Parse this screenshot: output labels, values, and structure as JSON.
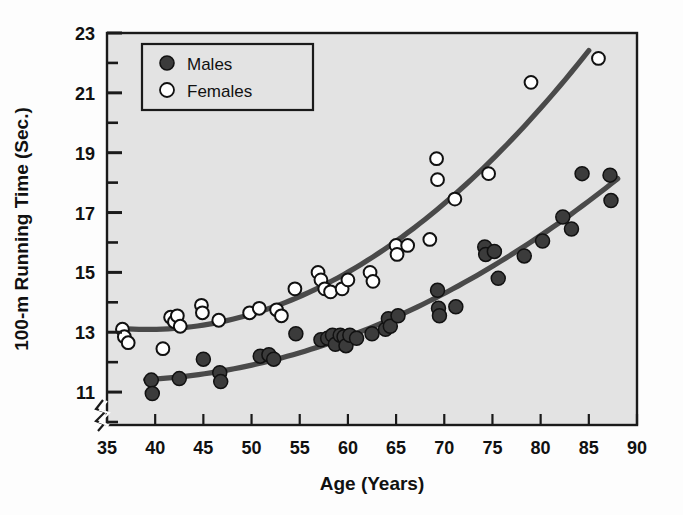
{
  "chart_data": {
    "type": "scatter",
    "title": "",
    "subtitle": "",
    "xlabel": "Age (Years)",
    "ylabel": "100-m Running Time (Sec.)",
    "xlim": [
      35,
      90
    ],
    "ylim": [
      9.9,
      23
    ],
    "xticks": [
      35,
      40,
      45,
      50,
      55,
      60,
      65,
      70,
      75,
      80,
      85,
      90
    ],
    "xtick_labels": [
      "35",
      "40",
      "45",
      "50",
      "55",
      "60",
      "65",
      "70",
      "75",
      "80",
      "85",
      "90"
    ],
    "yticks": [
      11,
      13,
      15,
      17,
      19,
      21,
      23
    ],
    "ytick_labels": [
      "11",
      "13",
      "15",
      "17",
      "19",
      "21",
      "23"
    ],
    "y_minor_ticks": [
      10,
      12,
      14,
      16,
      18,
      20,
      22
    ],
    "grid": false,
    "axis_break": true,
    "legend_position": "top-left",
    "plot_background": "#e2e2e2",
    "frame_color": "#1a1a1a",
    "series": [
      {
        "name": "Males",
        "marker": "filled-circle",
        "color": "#3b3b3b",
        "edge_color": "#111111",
        "points": [
          [
            39.6,
            11.4
          ],
          [
            39.7,
            10.95
          ],
          [
            42.5,
            11.45
          ],
          [
            45.0,
            12.1
          ],
          [
            46.7,
            11.65
          ],
          [
            46.8,
            11.35
          ],
          [
            50.9,
            12.2
          ],
          [
            51.8,
            12.25
          ],
          [
            52.3,
            12.1
          ],
          [
            54.6,
            12.95
          ],
          [
            57.2,
            12.75
          ],
          [
            57.9,
            12.8
          ],
          [
            58.4,
            12.9
          ],
          [
            58.7,
            12.6
          ],
          [
            59.2,
            12.9
          ],
          [
            59.6,
            12.85
          ],
          [
            59.8,
            12.55
          ],
          [
            60.2,
            12.9
          ],
          [
            60.9,
            12.8
          ],
          [
            62.5,
            12.95
          ],
          [
            63.9,
            13.1
          ],
          [
            64.2,
            13.45
          ],
          [
            64.4,
            13.2
          ],
          [
            65.2,
            13.55
          ],
          [
            69.3,
            14.4
          ],
          [
            69.4,
            13.8
          ],
          [
            69.5,
            13.55
          ],
          [
            71.2,
            13.85
          ],
          [
            74.2,
            15.85
          ],
          [
            74.3,
            15.6
          ],
          [
            75.2,
            15.7
          ],
          [
            75.6,
            14.8
          ],
          [
            78.3,
            15.55
          ],
          [
            80.2,
            16.05
          ],
          [
            82.3,
            16.85
          ],
          [
            83.2,
            16.45
          ],
          [
            84.3,
            18.3
          ],
          [
            87.2,
            18.25
          ],
          [
            87.3,
            17.4
          ]
        ],
        "fit_curve": {
          "type": "quadratic",
          "x_start": 39,
          "x_end": 88,
          "description": "Lower trend line for males rising from ~11.4s at age 39 to ~18.0s at age 88"
        }
      },
      {
        "name": "Females",
        "marker": "open-circle",
        "color": "#ffffff",
        "edge_color": "#111111",
        "points": [
          [
            36.6,
            13.1
          ],
          [
            36.8,
            12.85
          ],
          [
            37.2,
            12.65
          ],
          [
            40.8,
            12.45
          ],
          [
            41.6,
            13.5
          ],
          [
            42.0,
            13.35
          ],
          [
            42.3,
            13.55
          ],
          [
            42.6,
            13.2
          ],
          [
            44.8,
            13.9
          ],
          [
            44.9,
            13.65
          ],
          [
            46.6,
            13.4
          ],
          [
            49.8,
            13.65
          ],
          [
            50.8,
            13.8
          ],
          [
            52.6,
            13.75
          ],
          [
            53.1,
            13.55
          ],
          [
            54.5,
            14.45
          ],
          [
            56.9,
            15.0
          ],
          [
            57.2,
            14.75
          ],
          [
            57.6,
            14.45
          ],
          [
            58.2,
            14.35
          ],
          [
            59.4,
            14.45
          ],
          [
            60.0,
            14.75
          ],
          [
            62.3,
            15.0
          ],
          [
            62.6,
            14.7
          ],
          [
            65.0,
            15.9
          ],
          [
            65.1,
            15.6
          ],
          [
            66.2,
            15.9
          ],
          [
            68.5,
            16.1
          ],
          [
            69.2,
            18.8
          ],
          [
            69.3,
            18.1
          ],
          [
            71.1,
            17.45
          ],
          [
            74.6,
            18.3
          ],
          [
            79.0,
            21.35
          ],
          [
            86.0,
            22.15
          ]
        ],
        "fit_curve": {
          "type": "quadratic",
          "x_start": 36.5,
          "x_end": 85,
          "description": "Upper trend line for females rising from ~13.1s at age 37 to ~22.9s at age 85"
        }
      }
    ],
    "legend": [
      {
        "label": "Males",
        "marker": "filled-circle"
      },
      {
        "label": "Females",
        "marker": "open-circle"
      }
    ]
  },
  "axes": {
    "x_title": "Age (Years)",
    "y_title": "100-m Running Time (Sec.)"
  },
  "legend_box": {
    "items": [
      {
        "label": "Males"
      },
      {
        "label": "Females"
      }
    ]
  }
}
